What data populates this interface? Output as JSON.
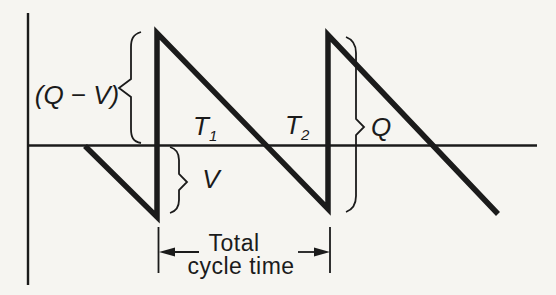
{
  "figure": {
    "kind": "sawtooth-cycle-waveform-diagram",
    "width": 556,
    "height": 295
  },
  "colors": {
    "paper": "#f6f5f1",
    "ink": "#1b1b1b"
  },
  "labels": {
    "q_minus_v": "(Q − V)",
    "t1_main": "T",
    "t1_sub": "1",
    "t2_main": "T",
    "t2_sub": "2",
    "q": "Q",
    "v": "V",
    "cycle_line1": "Total",
    "cycle_line2": "cycle time"
  },
  "geometry": {
    "y_axis": "M28,13 L28,285",
    "x_axis": "M27,145.5 L537,145.5",
    "waveform": "M85,146 L157,217 L157,33 L328,209 L328,35 L498,214",
    "brace_q_minus_v": "M141,32 C133,34.5 131,39 131,47 L131,79 L119,88 L131,97 L131,129 C131,137 133,141.5 141,143",
    "brace_v": "M170,147 C177,149 179,154 179,160 L179,174 L187,182 L179,190 L179,200 C179,206.5 177,211 170,213",
    "brace_q": "M346,37 C354,40 356,45.5 356,53 L356,119 L364,127 L356,135 L356,196 C356,203.5 354,209 346,212",
    "cycle_tick_left": "M158.5,227 L158.5,273",
    "cycle_tick_right": "M330,227 L330,273",
    "cycle_arrow_left_line": "M199,252 L165,252",
    "cycle_arrow_right_line": "M298,252 L323,252",
    "cycle_arrowhead_left": "159,252 175,247.5 175,256.5",
    "cycle_arrowhead_right": "330,252 314,247.5 314,256.5"
  }
}
